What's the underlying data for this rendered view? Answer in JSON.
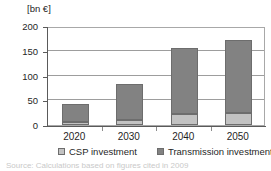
{
  "chart_data": {
    "type": "bar",
    "title": "",
    "subtitle": "",
    "xlabel": "",
    "ylabel": "[bn €]",
    "unit_label": "[bn €]",
    "categories": [
      "2020",
      "2030",
      "2040",
      "2050"
    ],
    "series": [
      {
        "name": "CSP investment",
        "color": "#c2c2c2",
        "values": [
          7,
          10,
          23,
          25
        ]
      },
      {
        "name": "Transmission investment",
        "color": "#828282",
        "values": [
          35,
          73,
          132,
          147
        ]
      }
    ],
    "totals": [
      42,
      83,
      155,
      172
    ],
    "stacked": true,
    "ylim": [
      0,
      200
    ],
    "yticks": [
      "0",
      "50",
      "100",
      "150",
      "200"
    ],
    "ytick_values": [
      0,
      50,
      100,
      150,
      200
    ],
    "grid": "horizontal",
    "legend_position": "bottom"
  },
  "legend": {
    "items": [
      {
        "label": "CSP investment",
        "color": "#c2c2c2"
      },
      {
        "label": "Transmission investment",
        "color": "#828282"
      }
    ]
  },
  "caption": {
    "text": "Source: Calculations based on figures cited in 2009"
  }
}
